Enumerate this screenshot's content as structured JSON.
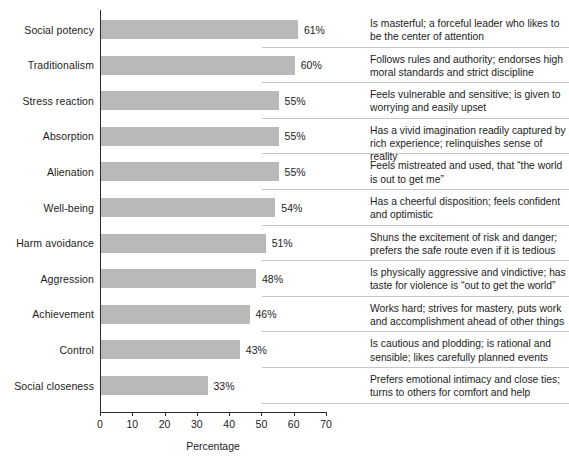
{
  "chart_data": {
    "type": "bar",
    "orientation": "horizontal",
    "title": "",
    "xlabel": "Percentage",
    "ylabel": "",
    "xlim": [
      0,
      70
    ],
    "xticks": [
      0,
      10,
      20,
      30,
      40,
      50,
      60,
      70
    ],
    "grid": false,
    "legend": null,
    "bar_color": "#b9b9b9",
    "axis_color": "#2b2b2b",
    "rule_color": "#c6c6c6",
    "categories": [
      "Social potency",
      "Traditionalism",
      "Stress reaction",
      "Absorption",
      "Alienation",
      "Well-being",
      "Harm avoidance",
      "Aggression",
      "Achievement",
      "Control",
      "Social closeness"
    ],
    "values": [
      61,
      60,
      55,
      55,
      55,
      54,
      51,
      48,
      46,
      43,
      33
    ],
    "value_labels": [
      "61%",
      "60%",
      "55%",
      "55%",
      "55%",
      "54%",
      "51%",
      "48%",
      "46%",
      "43%",
      "33%"
    ],
    "descriptions": [
      "Is masterful; a forceful leader who likes to be the center of attention",
      "Follows rules and authority; endorses high moral standards and strict discipline",
      "Feels vulnerable and sensitive; is given to worrying and easily upset",
      "Has a vivid imagination readily captured by rich experience; relinquishes sense of reality",
      "Feels mistreated and used, that “the world is out to get me”",
      "Has a cheerful disposition; feels confident and optimistic",
      "Shuns the excitement of risk and danger; prefers the safe route even if it is tedious",
      "Is physically aggressive and vindictive; has taste for violence is “out to get the world”",
      "Works hard; strives for mastery, puts work and accomplishment ahead of other things",
      "Is cautious and plodding; is rational and sensible; likes carefully planned events",
      "Prefers emotional intimacy and close ties; turns to others for comfort and help"
    ]
  }
}
